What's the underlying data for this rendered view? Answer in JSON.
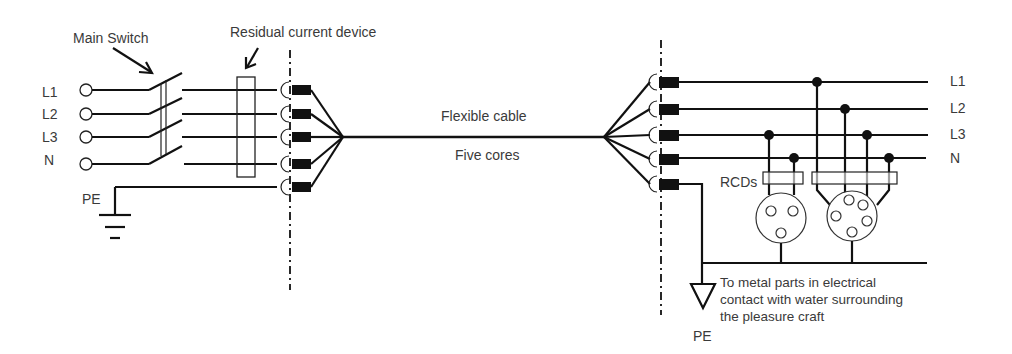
{
  "diagram": {
    "labels": {
      "main_switch": "Main Switch",
      "rcd": "Residual current device",
      "flexible_cable": "Flexible cable",
      "five_cores": "Five cores",
      "rcds": "RCDs",
      "pe_left": "PE",
      "pe_right": "PE",
      "note_line1": "To metal parts in electrical",
      "note_line2": "contact with water surrounding",
      "note_line3": "the pleasure craft"
    },
    "supply_conductors_left": [
      "L1",
      "L2",
      "L3",
      "N"
    ],
    "supply_conductors_right": [
      "L1",
      "L2",
      "L3",
      "N"
    ],
    "components": [
      "main switch (4-pole)",
      "residual current device",
      "plug/socket connector (5-pin, each end)",
      "flexible cable (5 cores)",
      "RCDs (2)",
      "single-phase socket outlet",
      "three-phase socket outlet",
      "earth electrode",
      "PE conductor to metal parts"
    ]
  }
}
